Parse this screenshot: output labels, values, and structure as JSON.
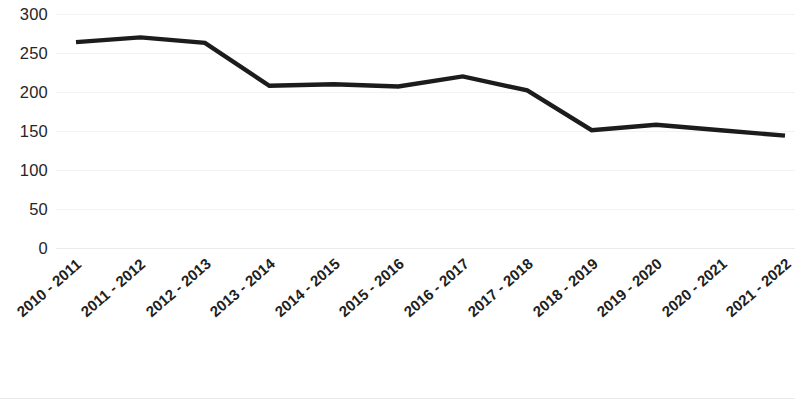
{
  "chart_data": {
    "type": "line",
    "title": "",
    "subtitle": "",
    "xlabel": "",
    "ylabel": "",
    "categories": [
      "2010 - 2011",
      "2011 - 2012",
      "2012 - 2013",
      "2013 - 2014",
      "2014 - 2015",
      "2015 - 2016",
      "2016 - 2017",
      "2017 - 2018",
      "2018 - 2019",
      "2019 - 2020",
      "2020 - 2021",
      "2021 - 2022"
    ],
    "values": [
      264,
      270,
      263,
      208,
      210,
      207,
      220,
      202,
      151,
      158,
      151,
      144
    ],
    "series": [
      {
        "name": "",
        "values": [
          264,
          270,
          263,
          208,
          210,
          207,
          220,
          202,
          151,
          158,
          151,
          144
        ],
        "color": "#1c1c1c"
      }
    ],
    "ylim": [
      0,
      300
    ],
    "y_ticks": [
      0,
      50,
      100,
      150,
      200,
      250,
      300
    ],
    "y_tick_labels": [
      "0",
      "50",
      "100",
      "150",
      "200",
      "250",
      "300"
    ],
    "grid": true,
    "grid_color": "#f2f2f2",
    "legend": false,
    "legend_position": "none",
    "line_color": "#1c1c1c",
    "background_color": "#ffffff",
    "annotations": []
  }
}
